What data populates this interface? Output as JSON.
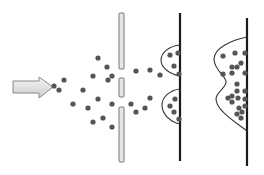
{
  "diagram": {
    "title": "",
    "colors": {
      "background": "#ffffff",
      "particle": "#555555",
      "arrow_fill_light": "#f0f0f0",
      "arrow_fill_dark": "#cfcfcf",
      "arrow_stroke": "#8a8a8a",
      "slit_fill": "#e6e6e6",
      "slit_stroke": "#777777",
      "screen": "#1a1a1a",
      "curve": "#333333"
    },
    "source_arrow": {
      "points": "13,81 39,81 39,77 53,87 39,98 39,93 13,93"
    },
    "barrier": {
      "x": 119,
      "width": 5,
      "segments": [
        {
          "y": 13,
          "height": 56
        },
        {
          "y": 78,
          "height": 19
        },
        {
          "y": 107,
          "height": 55
        }
      ]
    },
    "screens": [
      {
        "name": "two-slit-screen",
        "x": 180,
        "y1": 13,
        "y2": 161
      },
      {
        "name": "single-distribution-screen",
        "x": 247,
        "y1": 18,
        "y2": 166
      }
    ],
    "curves": [
      {
        "name": "interference-upper-peak",
        "d": "M180,45 C170,46 161,52 161,60 C161,68 170,74 180,76"
      },
      {
        "name": "interference-lower-peak",
        "d": "M180,89 C170,90 162,97 162,105 C162,114 170,122 180,124"
      },
      {
        "name": "combined-distribution",
        "d": "M247,37 C232,40 214,48 214,59 C214,70 226,76 226,82 C226,88 216,92 216,99 C216,110 235,122 247,131"
      }
    ],
    "particles": [
      [
        54,
        86
      ],
      [
        64,
        80
      ],
      [
        59,
        90
      ],
      [
        83,
        90
      ],
      [
        73,
        104
      ],
      [
        88,
        108
      ],
      [
        98,
        99
      ],
      [
        93,
        76
      ],
      [
        98,
        58
      ],
      [
        107,
        67
      ],
      [
        112,
        76
      ],
      [
        108,
        80
      ],
      [
        112,
        104
      ],
      [
        103,
        118
      ],
      [
        93,
        122
      ],
      [
        112,
        127
      ],
      [
        136,
        71
      ],
      [
        150,
        70
      ],
      [
        160,
        75
      ],
      [
        150,
        98
      ],
      [
        131,
        104
      ],
      [
        145,
        108
      ],
      [
        136,
        112
      ],
      [
        178,
        53
      ],
      [
        170,
        55
      ],
      [
        174,
        66
      ],
      [
        179,
        74
      ],
      [
        175,
        99
      ],
      [
        170,
        106
      ],
      [
        174,
        112
      ],
      [
        179,
        119
      ],
      [
        223,
        56
      ],
      [
        235,
        53
      ],
      [
        245,
        53
      ],
      [
        241,
        63
      ],
      [
        232,
        67
      ],
      [
        237,
        67
      ],
      [
        245,
        73
      ],
      [
        232,
        73
      ],
      [
        223,
        74
      ],
      [
        237,
        84
      ],
      [
        237,
        91
      ],
      [
        245,
        91
      ],
      [
        232,
        96
      ],
      [
        228,
        98
      ],
      [
        238,
        98
      ],
      [
        245,
        99
      ],
      [
        232,
        102
      ],
      [
        245,
        106
      ],
      [
        239,
        108
      ],
      [
        242,
        112
      ],
      [
        237,
        114
      ],
      [
        241,
        118
      ]
    ]
  }
}
